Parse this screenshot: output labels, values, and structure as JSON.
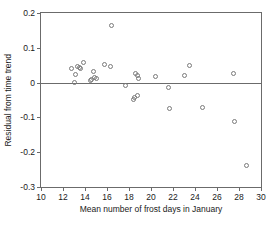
{
  "chart_data": {
    "type": "scatter",
    "title": "",
    "xlabel": "Mean number of frost days in January",
    "ylabel": "Residual from time trend",
    "xlim": [
      10,
      30
    ],
    "ylim": [
      -0.3,
      0.2
    ],
    "xticks": [
      10,
      12,
      14,
      16,
      18,
      20,
      22,
      24,
      26,
      28,
      30
    ],
    "xtick_labels": [
      "10",
      "12",
      "14",
      "16",
      "18",
      "20",
      "22",
      "24",
      "26",
      "28",
      "30"
    ],
    "yticks": [
      0.2,
      0.1,
      0,
      -0.1,
      -0.2,
      -0.3
    ],
    "ytick_labels": [
      "0.2",
      "0.1",
      "0",
      "-0.1",
      "-0.2",
      "-0.3"
    ],
    "grid": false,
    "legend": null,
    "reference_lines": [
      {
        "axis": "y",
        "value": 0,
        "style": "solid"
      }
    ],
    "marker": "open-circle",
    "marker_color": "#7a7a7a",
    "points": [
      {
        "x": 12.8,
        "y": 0.04
      },
      {
        "x": 13.0,
        "y": 0.0
      },
      {
        "x": 13.1,
        "y": 0.022
      },
      {
        "x": 13.3,
        "y": 0.046
      },
      {
        "x": 13.5,
        "y": 0.044
      },
      {
        "x": 13.6,
        "y": 0.04
      },
      {
        "x": 13.9,
        "y": 0.059
      },
      {
        "x": 14.5,
        "y": 0.006
      },
      {
        "x": 14.6,
        "y": 0.008
      },
      {
        "x": 14.8,
        "y": 0.033
      },
      {
        "x": 14.9,
        "y": 0.014
      },
      {
        "x": 15.0,
        "y": 0.012
      },
      {
        "x": 15.8,
        "y": 0.052
      },
      {
        "x": 16.3,
        "y": 0.047
      },
      {
        "x": 16.4,
        "y": 0.163
      },
      {
        "x": 17.7,
        "y": -0.007
      },
      {
        "x": 18.4,
        "y": -0.048
      },
      {
        "x": 18.5,
        "y": -0.043
      },
      {
        "x": 18.6,
        "y": 0.026
      },
      {
        "x": 18.8,
        "y": -0.038
      },
      {
        "x": 18.8,
        "y": 0.019
      },
      {
        "x": 18.9,
        "y": 0.013
      },
      {
        "x": 20.4,
        "y": 0.018
      },
      {
        "x": 21.6,
        "y": -0.015
      },
      {
        "x": 21.7,
        "y": -0.075
      },
      {
        "x": 23.0,
        "y": 0.02
      },
      {
        "x": 23.5,
        "y": 0.05
      },
      {
        "x": 24.7,
        "y": -0.072
      },
      {
        "x": 27.5,
        "y": 0.027
      },
      {
        "x": 27.6,
        "y": -0.113
      },
      {
        "x": 28.7,
        "y": -0.237
      }
    ]
  }
}
